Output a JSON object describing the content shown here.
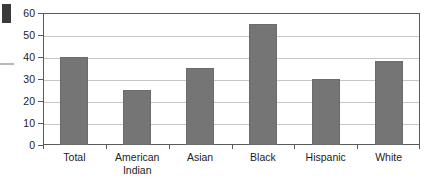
{
  "chart_data": {
    "type": "bar",
    "title": "",
    "xlabel": "",
    "ylabel": "",
    "categories": [
      "Total",
      "American\nIndian",
      "Asian",
      "Black",
      "Hispanic",
      "White"
    ],
    "values": [
      40,
      25,
      35,
      55,
      30,
      38
    ],
    "ylim": [
      0,
      60
    ],
    "ytick_labels": [
      "0",
      "10",
      "20",
      "30",
      "40",
      "50",
      "60"
    ],
    "ytick_values": [
      0,
      10,
      20,
      30,
      40,
      50,
      60
    ],
    "grid": "horizontal",
    "legend": "none",
    "bar_color": "#757575",
    "axis_color": "#5a5a5a",
    "gridline_color": "#c6c6c6",
    "text_color": "#1c1c1c"
  },
  "artifacts": {
    "corner_block_color": "#3a3a3a",
    "edge_line_color": "#b9b9b9"
  }
}
